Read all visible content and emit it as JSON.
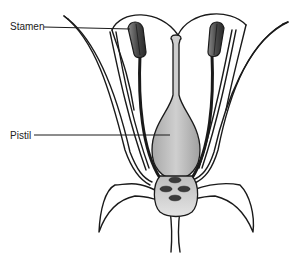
{
  "diagram": {
    "labels": [
      {
        "id": "stamen",
        "text": "Stamen"
      },
      {
        "id": "pistil",
        "text": "Pistil"
      }
    ],
    "colors": {
      "outline": "#1a1a1a",
      "pistil_fill": "#b8b8b8",
      "ovary_fill": "#c4c4c4",
      "anther_fill": "#6a6a6a",
      "ovule_fill": "#3a3a3a",
      "background": "#ffffff"
    }
  }
}
